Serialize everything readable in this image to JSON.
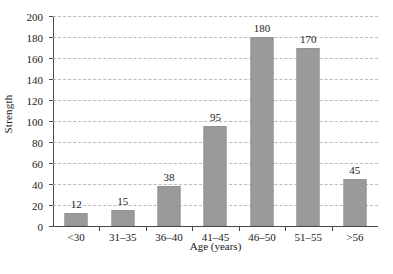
{
  "chart_data": {
    "type": "bar",
    "title": "",
    "subtitle": "",
    "xlabel": "Age (years)",
    "ylabel": "Strength",
    "categories": [
      "<30",
      "31–35",
      "36–40",
      "41–45",
      "46–50",
      "51–55",
      ">56"
    ],
    "values": [
      12,
      15,
      38,
      95,
      180,
      170,
      45
    ],
    "data_labels": [
      "12",
      "15",
      "38",
      "95",
      "180",
      "170",
      "45"
    ],
    "ylim": [
      0,
      200
    ],
    "ytick_step": 20,
    "ytick_labels": [
      "0",
      "20",
      "40",
      "60",
      "80",
      "100",
      "120",
      "140",
      "160",
      "180",
      "200"
    ],
    "ytick_values": [
      0,
      20,
      40,
      60,
      80,
      100,
      120,
      140,
      160,
      180,
      200
    ],
    "grid": true,
    "grid_axis": "y",
    "grid_style": "dashed",
    "legend": false,
    "legend_position": "none",
    "bar_color": "#9a9a9a",
    "grid_color": "#b9b9c6",
    "axis_color": "#4a4a4a",
    "text_color": "#1a1a1a",
    "background_color": "#ffffff"
  }
}
